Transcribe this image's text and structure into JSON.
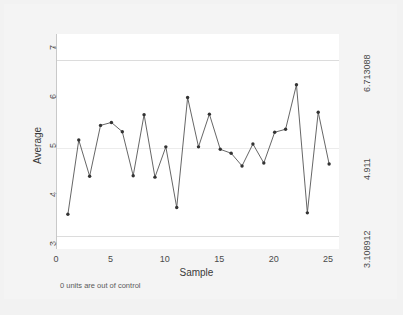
{
  "chart_data": {
    "type": "line",
    "title": "",
    "subtitle": "",
    "xlabel": "Sample",
    "ylabel": "Average",
    "x": [
      1,
      2,
      3,
      4,
      5,
      6,
      7,
      8,
      9,
      10,
      11,
      12,
      13,
      14,
      15,
      16,
      17,
      18,
      19,
      20,
      21,
      22,
      23,
      24,
      25
    ],
    "values": [
      3.56,
      5.08,
      4.34,
      5.38,
      5.44,
      5.25,
      4.35,
      5.6,
      4.32,
      4.94,
      3.7,
      5.95,
      4.94,
      5.61,
      4.89,
      4.81,
      4.55,
      5.0,
      4.61,
      5.24,
      5.3,
      6.21,
      3.59,
      5.65,
      4.59
    ],
    "series": [
      {
        "name": "Average",
        "values": [
          3.56,
          5.08,
          4.34,
          5.38,
          5.44,
          5.25,
          4.35,
          5.6,
          4.32,
          4.94,
          3.7,
          5.95,
          4.94,
          5.61,
          4.89,
          4.81,
          4.55,
          5.0,
          4.61,
          5.24,
          5.3,
          6.21,
          3.59,
          5.65,
          4.59
        ]
      }
    ],
    "xlim": [
      0,
      26
    ],
    "ylim": [
      2.85,
      7.25
    ],
    "xticks": [
      "0",
      "5",
      "10",
      "15",
      "20",
      "25"
    ],
    "xtick_values": [
      0,
      5,
      10,
      15,
      20,
      25
    ],
    "yticks": [
      "3",
      "4",
      "5",
      "6",
      "7"
    ],
    "ytick_values": [
      3,
      4,
      5,
      6,
      7
    ],
    "grid": false,
    "legend": "none",
    "marker": "circle",
    "line_color": "#555555",
    "marker_color": "#333333",
    "control_lines": [
      {
        "name": "upper-control-limit",
        "label": "6.713088",
        "value": 6.713088
      },
      {
        "name": "center-line",
        "label": "4.911",
        "value": 4.911
      },
      {
        "name": "lower-control-limit",
        "label": "3.108912",
        "value": 3.108912
      }
    ],
    "right_axis_labels": [
      "6.713088",
      "4.911",
      "3.108912"
    ],
    "annotations": [
      "0 units are out of control"
    ]
  },
  "axes": {
    "y_label": "Average",
    "x_label": "Sample",
    "y_ticks": [
      "3",
      "4",
      "5",
      "6",
      "7"
    ],
    "x_ticks": [
      "0",
      "5",
      "10",
      "15",
      "20",
      "25"
    ],
    "right_ticks": {
      "ucl": "6.713088",
      "center": "4.911",
      "lcl": "3.108912"
    }
  },
  "footer": {
    "out_of_control_note": "0 units are out of control"
  },
  "colors": {
    "page_background": "#f2f2f2",
    "panel_background": "#ffffff",
    "line": "#555555",
    "limit_line": "#dcdcdc",
    "center_line": "#ececec",
    "text": "#4a4a4a"
  }
}
